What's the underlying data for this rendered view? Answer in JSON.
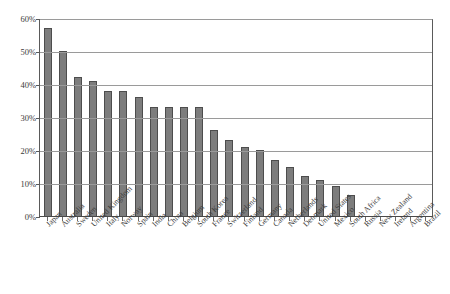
{
  "chart_data": {
    "type": "bar",
    "title": "",
    "subtitle": "",
    "xlabel": "",
    "ylabel": "",
    "ylim": [
      0,
      60
    ],
    "ytick_labels": [
      "0%",
      "10%",
      "20%",
      "30%",
      "40%",
      "50%",
      "60%"
    ],
    "ytick_values": [
      0,
      10,
      20,
      30,
      40,
      50,
      60
    ],
    "grid": "horizontal",
    "legend": "none",
    "bar_color": "#7d7d7d",
    "bar_edge_color": "#4d4d4d",
    "gridline_color": "#9a9a9a",
    "axis_color": "#5a5a5a",
    "categories": [
      "Japan",
      "Australia",
      "Sweden",
      "United Kingdom",
      "Italy",
      "Norway",
      "Spain",
      "India",
      "China",
      "Belgium",
      "South Korea",
      "France",
      "Switzerland",
      "Finland",
      "Germany",
      "Canada",
      "Netherlands",
      "Denmark",
      "United States",
      "Mexico",
      "South Africa",
      "Russia",
      "New Zealand",
      "Ireland",
      "Argentina",
      "Brazil"
    ],
    "values": [
      57,
      50,
      42,
      41,
      38,
      38,
      36,
      33,
      33,
      33,
      33,
      26,
      23,
      21,
      20,
      17,
      15,
      12,
      11,
      9,
      6.5,
      0,
      0,
      0,
      0,
      0
    ]
  }
}
